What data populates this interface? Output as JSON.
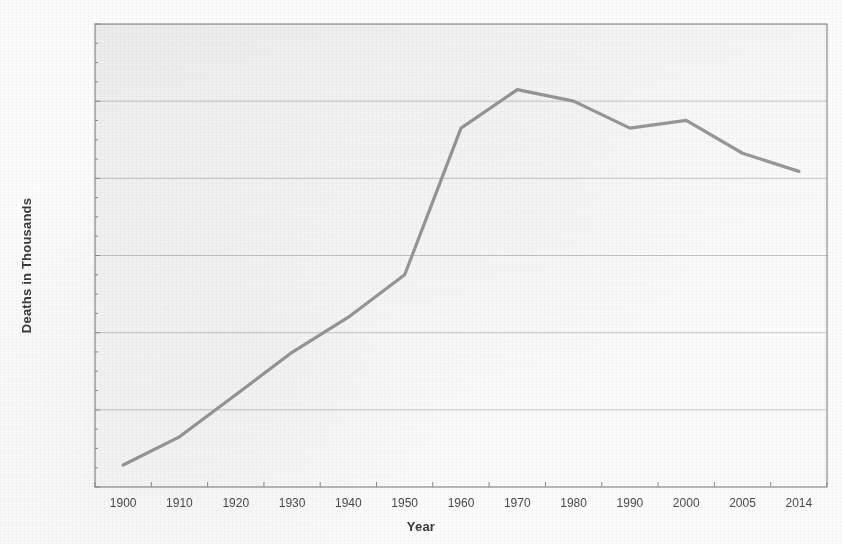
{
  "chart_data": {
    "type": "line",
    "title": "",
    "xlabel": "Year",
    "ylabel": "Deaths in Thousands",
    "categories": [
      "1900",
      "1910",
      "1920",
      "1930",
      "1940",
      "1950",
      "1960",
      "1970",
      "1980",
      "1990",
      "2000",
      "2005",
      "2014"
    ],
    "values": [
      57,
      130,
      239,
      349,
      440,
      550,
      930,
      1030,
      1000,
      930,
      950,
      865,
      818
    ],
    "series": [
      {
        "name": "Deaths",
        "values": [
          57,
          130,
          239,
          349,
          440,
          550,
          930,
          1030,
          1000,
          930,
          950,
          865,
          818
        ]
      }
    ],
    "ylim": [
      0,
      1200
    ],
    "ytick_values": [
      0,
      200,
      400,
      600,
      800,
      1000,
      1200
    ],
    "ytick_labels": [
      "0",
      "200",
      "400",
      "600",
      "800",
      "1,000",
      "1,200"
    ],
    "grid": true,
    "legend": false,
    "legend_position": "none",
    "line_color": "#9a9a9a",
    "gridline_color": "#c9c9c9",
    "border_color": "#8d8d8d",
    "background_color": "#fcfcfc"
  }
}
